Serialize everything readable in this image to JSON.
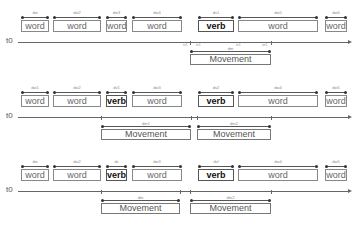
{
  "origin_label": "t0",
  "rows": [
    {
      "boxes": [
        {
          "text": "word",
          "x": 21,
          "w": 28,
          "label": "dw"
        },
        {
          "text": "word",
          "x": 53,
          "w": 48,
          "label": "dw2"
        },
        {
          "text": "word",
          "x": 106,
          "w": 21,
          "label": "dw3"
        },
        {
          "text": "word",
          "x": 132,
          "w": 50,
          "label": "dw4"
        },
        {
          "text": "verb",
          "x": 198,
          "w": 36,
          "label": "dv1",
          "verb": true
        },
        {
          "text": "word",
          "x": 238,
          "w": 80,
          "label": "dw5"
        },
        {
          "text": "word",
          "x": 325,
          "w": 22,
          "label": "dw6"
        }
      ],
      "tick_labels": [
        "tv1",
        "tv1",
        "tv1",
        "tw1"
      ],
      "movements": [
        {
          "text": "Movement",
          "x": 190,
          "w": 81,
          "label": "dm"
        }
      ]
    },
    {
      "boxes": [
        {
          "text": "word",
          "x": 21,
          "w": 28,
          "label": "dw1"
        },
        {
          "text": "word",
          "x": 53,
          "w": 48,
          "label": "dw2"
        },
        {
          "text": "verb",
          "x": 106,
          "w": 21,
          "label": "dv1",
          "verb": true
        },
        {
          "text": "word",
          "x": 132,
          "w": 50,
          "label": "dw3"
        },
        {
          "text": "verb",
          "x": 198,
          "w": 36,
          "label": "dv2",
          "verb": true
        },
        {
          "text": "word",
          "x": 238,
          "w": 80,
          "label": "dw4"
        },
        {
          "text": "word",
          "x": 325,
          "w": 22,
          "label": "dw5"
        }
      ],
      "movements": [
        {
          "text": "Movement",
          "x": 101,
          "w": 90,
          "label": "dm1"
        },
        {
          "text": "Movement",
          "x": 197,
          "w": 74,
          "label": "dm2"
        }
      ]
    },
    {
      "boxes": [
        {
          "text": "word",
          "x": 21,
          "w": 28,
          "label": "dw"
        },
        {
          "text": "word",
          "x": 53,
          "w": 48,
          "label": "dw2"
        },
        {
          "text": "verb",
          "x": 106,
          "w": 21,
          "label": "dv",
          "verb": true
        },
        {
          "text": "word",
          "x": 132,
          "w": 50,
          "label": "dw3"
        },
        {
          "text": "verb",
          "x": 198,
          "w": 36,
          "label": "dvl",
          "verb": true
        },
        {
          "text": "word",
          "x": 238,
          "w": 80,
          "label": "dw4"
        },
        {
          "text": "word",
          "x": 325,
          "w": 22,
          "label": "dw5"
        }
      ],
      "movements": [
        {
          "text": "Movement",
          "x": 101,
          "w": 79,
          "label": "dm"
        },
        {
          "text": "Movement",
          "x": 190,
          "w": 81,
          "label": "dm2"
        }
      ]
    }
  ]
}
